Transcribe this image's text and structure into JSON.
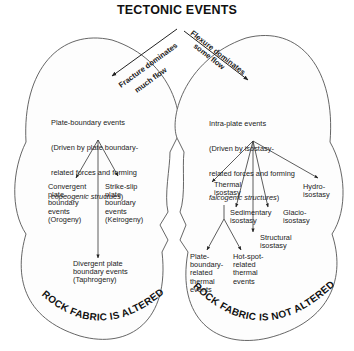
{
  "title": "TECTONIC EVENTS",
  "branches": {
    "left_label_line1": "Fracture dominates",
    "left_label_line2": "much flow",
    "right_label_line1": "Flexure dominates",
    "right_label_line2": "some flow"
  },
  "left": {
    "heading_line1": "Plate-boundary events",
    "heading_line2": "(Driven by plate boundary-",
    "heading_line3": "related forces and forming",
    "heading_italic": "copeogenic structues",
    "heading_close": ")",
    "children": [
      {
        "label": "Convergent\nplate\nboundary\nevents\n(Orogeny)"
      },
      {
        "label": "Strike-slip\nplate\nboundary\nevents\n(Keirogeny)"
      },
      {
        "label": "Divergent plate\nboundary events\n(Taphrogeny)"
      }
    ],
    "footer": "ROCK FABRIC IS ALTERED"
  },
  "right": {
    "heading_line1": "Intra-plate events",
    "heading_line2": "(Driven by isostasy-",
    "heading_line3": "related forces and forming",
    "heading_italic": "falcogenic structures",
    "heading_close": ")",
    "children": [
      {
        "label": "Thermal\nisostasy"
      },
      {
        "label": "Sedimentary\nisostasy"
      },
      {
        "label": "Structural\nisostasy"
      },
      {
        "label": "Glacio-\nisostasy"
      },
      {
        "label": "Hydro-\nisostasy"
      }
    ],
    "thermal_children": [
      {
        "label": "Plate-\nboundary-\nrelated\nthermal\nevents"
      },
      {
        "label": "Hot-spot-\nrelated\nthermal\nevents"
      }
    ],
    "footer": "ROCK FABRIC IS NOT ALTERED"
  }
}
